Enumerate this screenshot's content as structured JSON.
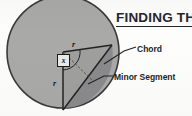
{
  "figure": {
    "title": "FINDING THE",
    "title_style": "underlined-bold-truncated",
    "background_color": "#fdfdfb",
    "ink_color": "#1e1f22"
  },
  "labels": {
    "chord": "Chord",
    "minor_segment": "Minor Segment",
    "radius_top": "r",
    "radius_bottom": "r",
    "angle": "x"
  },
  "colors": {
    "circle_fill": "#a9a9a7",
    "circle_stroke": "#3a3a3c",
    "segment_fill": "#8b8b89",
    "sector_fill": "#9e9e9c",
    "line": "#232326",
    "dashed_line": "#4a4a4d"
  },
  "geometry": {
    "circle": {
      "cx": 63,
      "cy": 52,
      "r": 56
    },
    "center_point": {
      "x": 63,
      "y": 52
    },
    "chord_endpoint_upper": {
      "x": 112,
      "y": 45
    },
    "chord_endpoint_lower": {
      "x": 63,
      "y": 110
    },
    "angle_value_symbol": "x",
    "radius_symbol": "r"
  }
}
